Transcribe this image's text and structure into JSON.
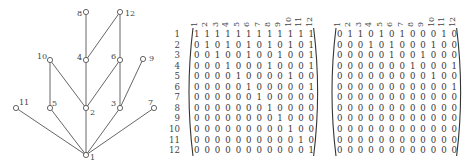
{
  "hasse_diagram": {
    "title": "Hasse diagram of divisibility on {1,...,12}",
    "nodes": [
      {
        "id": "1",
        "x": 86,
        "y": 155,
        "label_dx": 4,
        "label_dy": 5
      },
      {
        "id": "2",
        "x": 86,
        "y": 108,
        "label_dx": 4,
        "label_dy": 7
      },
      {
        "id": "3",
        "x": 120,
        "y": 108,
        "label_dx": -9,
        "label_dy": -2
      },
      {
        "id": "4",
        "x": 86,
        "y": 60,
        "label_dx": -9,
        "label_dy": 0
      },
      {
        "id": "5",
        "x": 50,
        "y": 108,
        "label_dx": 2,
        "label_dy": -2
      },
      {
        "id": "6",
        "x": 120,
        "y": 60,
        "label_dx": -9,
        "label_dy": -1
      },
      {
        "id": "7",
        "x": 154,
        "y": 108,
        "label_dx": -6,
        "label_dy": -3
      },
      {
        "id": "8",
        "x": 86,
        "y": 12,
        "label_dx": -9,
        "label_dy": 4
      },
      {
        "id": "9",
        "x": 143,
        "y": 59,
        "label_dx": 6,
        "label_dy": 2
      },
      {
        "id": "10",
        "x": 50,
        "y": 60,
        "label_dx": -13,
        "label_dy": -1
      },
      {
        "id": "11",
        "x": 16,
        "y": 108,
        "label_dx": 3,
        "label_dy": -3
      },
      {
        "id": "12",
        "x": 120,
        "y": 12,
        "label_dx": 5,
        "label_dy": 4
      }
    ],
    "edges": [
      [
        "1",
        "2"
      ],
      [
        "1",
        "3"
      ],
      [
        "1",
        "5"
      ],
      [
        "1",
        "7"
      ],
      [
        "1",
        "11"
      ],
      [
        "2",
        "4"
      ],
      [
        "2",
        "6"
      ],
      [
        "2",
        "10"
      ],
      [
        "3",
        "6"
      ],
      [
        "3",
        "9"
      ],
      [
        "4",
        "8"
      ],
      [
        "4",
        "12"
      ],
      [
        "5",
        "10"
      ],
      [
        "6",
        "12"
      ]
    ]
  },
  "matrices": [
    {
      "name": "divisibility-relation-matrix",
      "row_labels": [
        "1",
        "2",
        "3",
        "4",
        "5",
        "6",
        "7",
        "8",
        "9",
        "10",
        "11",
        "12"
      ],
      "col_labels": [
        "1",
        "2",
        "3",
        "4",
        "5",
        "6",
        "7",
        "8",
        "9",
        "10",
        "11",
        "12"
      ],
      "rows": [
        [
          1,
          1,
          1,
          1,
          1,
          1,
          1,
          1,
          1,
          1,
          1,
          1
        ],
        [
          0,
          1,
          0,
          1,
          0,
          1,
          0,
          1,
          0,
          1,
          0,
          1
        ],
        [
          0,
          0,
          1,
          0,
          0,
          1,
          0,
          0,
          1,
          0,
          0,
          1
        ],
        [
          0,
          0,
          0,
          1,
          0,
          0,
          0,
          1,
          0,
          0,
          0,
          1
        ],
        [
          0,
          0,
          0,
          0,
          1,
          0,
          0,
          0,
          0,
          1,
          0,
          0
        ],
        [
          0,
          0,
          0,
          0,
          0,
          1,
          0,
          0,
          0,
          0,
          0,
          1
        ],
        [
          0,
          0,
          0,
          0,
          0,
          0,
          1,
          0,
          0,
          0,
          0,
          0
        ],
        [
          0,
          0,
          0,
          0,
          0,
          0,
          0,
          1,
          0,
          0,
          0,
          0
        ],
        [
          0,
          0,
          0,
          0,
          0,
          0,
          0,
          0,
          1,
          0,
          0,
          0
        ],
        [
          0,
          0,
          0,
          0,
          0,
          0,
          0,
          0,
          0,
          1,
          0,
          0
        ],
        [
          0,
          0,
          0,
          0,
          0,
          0,
          0,
          0,
          0,
          0,
          1,
          0
        ],
        [
          0,
          0,
          0,
          0,
          0,
          0,
          0,
          0,
          0,
          0,
          0,
          1
        ]
      ]
    },
    {
      "name": "covering-relation-matrix",
      "row_labels": [],
      "col_labels": [
        "1",
        "2",
        "3",
        "4",
        "5",
        "6",
        "7",
        "8",
        "9",
        "10",
        "11",
        "12"
      ],
      "rows": [
        [
          0,
          1,
          1,
          0,
          1,
          0,
          1,
          0,
          0,
          0,
          1,
          0
        ],
        [
          0,
          0,
          0,
          1,
          0,
          1,
          0,
          0,
          0,
          1,
          0,
          0
        ],
        [
          0,
          0,
          0,
          0,
          0,
          1,
          0,
          0,
          1,
          0,
          0,
          0
        ],
        [
          0,
          0,
          0,
          0,
          0,
          0,
          0,
          1,
          0,
          0,
          0,
          1
        ],
        [
          0,
          0,
          0,
          0,
          0,
          0,
          0,
          0,
          0,
          1,
          0,
          0
        ],
        [
          0,
          0,
          0,
          0,
          0,
          0,
          0,
          0,
          0,
          0,
          0,
          1
        ],
        [
          0,
          0,
          0,
          0,
          0,
          0,
          0,
          0,
          0,
          0,
          0,
          0
        ],
        [
          0,
          0,
          0,
          0,
          0,
          0,
          0,
          0,
          0,
          0,
          0,
          0
        ],
        [
          0,
          0,
          0,
          0,
          0,
          0,
          0,
          0,
          0,
          0,
          0,
          0
        ],
        [
          0,
          0,
          0,
          0,
          0,
          0,
          0,
          0,
          0,
          0,
          0,
          0
        ],
        [
          0,
          0,
          0,
          0,
          0,
          0,
          0,
          0,
          0,
          0,
          0,
          0
        ],
        [
          0,
          0,
          0,
          0,
          0,
          0,
          0,
          0,
          0,
          0,
          0,
          0
        ]
      ]
    }
  ],
  "layout": {
    "matrix_left_first_col_x": 194,
    "matrix_right_first_col_x": 337,
    "col_step": 10.42,
    "first_row_y": 37,
    "row_step": 10.55,
    "row_label_x": 180,
    "col_label_baseline_y": 27,
    "line_color": "#555555",
    "node_fill": "#ffffff"
  }
}
